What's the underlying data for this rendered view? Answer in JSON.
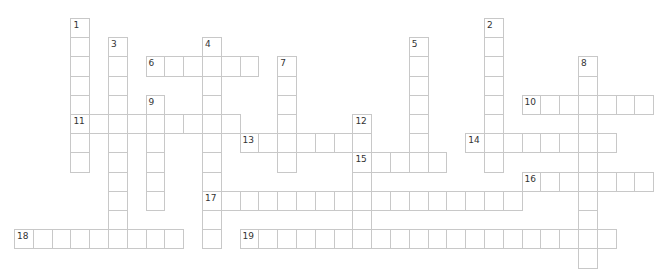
{
  "puzzle": {
    "type": "crossword",
    "grid": {
      "origin_x": 14,
      "origin_y": 18,
      "pitch_x": 18.8,
      "pitch_y": 19.2
    },
    "colors": {
      "cell_border": "#c8c8c8",
      "cell_fill": "#ffffff",
      "number": "#333333"
    },
    "entries": [
      {
        "number": "1",
        "direction": "down",
        "row": 0,
        "col": 3,
        "length": 8
      },
      {
        "number": "2",
        "direction": "down",
        "row": 0,
        "col": 25,
        "length": 8
      },
      {
        "number": "3",
        "direction": "down",
        "row": 1,
        "col": 5,
        "length": 11
      },
      {
        "number": "4",
        "direction": "down",
        "row": 1,
        "col": 10,
        "length": 11
      },
      {
        "number": "5",
        "direction": "down",
        "row": 1,
        "col": 21,
        "length": 7
      },
      {
        "number": "6",
        "direction": "across",
        "row": 2,
        "col": 7,
        "length": 6
      },
      {
        "number": "7",
        "direction": "down",
        "row": 2,
        "col": 14,
        "length": 6
      },
      {
        "number": "8",
        "direction": "down",
        "row": 2,
        "col": 30,
        "length": 11
      },
      {
        "number": "9",
        "direction": "down",
        "row": 4,
        "col": 7,
        "length": 6
      },
      {
        "number": "10",
        "direction": "across",
        "row": 4,
        "col": 27,
        "length": 7
      },
      {
        "number": "11",
        "direction": "across",
        "row": 5,
        "col": 3,
        "length": 9
      },
      {
        "number": "12",
        "direction": "down",
        "row": 5,
        "col": 18,
        "length": 7
      },
      {
        "number": "13",
        "direction": "across",
        "row": 6,
        "col": 12,
        "length": 7
      },
      {
        "number": "14",
        "direction": "across",
        "row": 6,
        "col": 24,
        "length": 8
      },
      {
        "number": "15",
        "direction": "across",
        "row": 7,
        "col": 18,
        "length": 5
      },
      {
        "number": "16",
        "direction": "across",
        "row": 8,
        "col": 27,
        "length": 7
      },
      {
        "number": "17",
        "direction": "across",
        "row": 9,
        "col": 10,
        "length": 17
      },
      {
        "number": "18",
        "direction": "across",
        "row": 11,
        "col": 0,
        "length": 9
      },
      {
        "number": "19",
        "direction": "across",
        "row": 11,
        "col": 12,
        "length": 20
      }
    ]
  }
}
